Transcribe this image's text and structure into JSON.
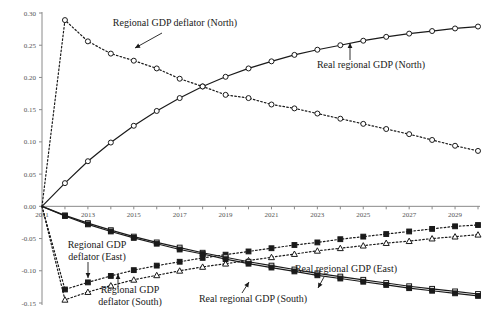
{
  "chart_data": {
    "type": "line",
    "title": "",
    "subtitle": "",
    "xlabel": "",
    "ylabel": "",
    "grid": false,
    "legend_position": "inline-annotations",
    "x": [
      2011,
      2012,
      2013,
      2014,
      2015,
      2016,
      2017,
      2018,
      2019,
      2020,
      2021,
      2022,
      2023,
      2024,
      2025,
      2026,
      2027,
      2028,
      2029,
      2030
    ],
    "xlim": [
      2011,
      2030
    ],
    "ylim": [
      -0.15,
      0.3
    ],
    "xticks": [
      2011,
      2013,
      2015,
      2017,
      2019,
      2021,
      2023,
      2025,
      2027,
      2029
    ],
    "xtick_labels": [
      "2011",
      "2013",
      "2015",
      "2017",
      "2019",
      "2021",
      "2023",
      "2025",
      "2027",
      "2029"
    ],
    "yticks": [
      0.3,
      0.25,
      0.2,
      0.15,
      0.1,
      0.05,
      0.0,
      -0.05,
      -0.1,
      -0.15
    ],
    "ytick_labels": [
      "0.30",
      "0.25",
      "0.20",
      "0.15",
      "0.10",
      "0.05",
      "0.00",
      "-0.05",
      "-0.10",
      "-0.15"
    ],
    "series": [
      {
        "name": "Regional GDP deflator (North)",
        "style": "dotted",
        "marker": "circle-open",
        "values": [
          0.0,
          0.289,
          0.256,
          0.237,
          0.226,
          0.214,
          0.198,
          0.186,
          0.173,
          0.168,
          0.158,
          0.152,
          0.144,
          0.136,
          0.128,
          0.12,
          0.112,
          0.103,
          0.094,
          0.086
        ]
      },
      {
        "name": "Real regional GDP (North)",
        "style": "solid",
        "marker": "circle-open",
        "values": [
          0.0,
          0.036,
          0.07,
          0.099,
          0.125,
          0.148,
          0.168,
          0.186,
          0.201,
          0.214,
          0.225,
          0.235,
          0.243,
          0.25,
          0.257,
          0.263,
          0.268,
          0.272,
          0.276,
          0.279
        ]
      },
      {
        "name": "Regional GDP deflator (East)",
        "style": "dotted",
        "marker": "square-filled",
        "values": [
          0.0,
          -0.129,
          -0.118,
          -0.108,
          -0.099,
          -0.092,
          -0.086,
          -0.08,
          -0.075,
          -0.07,
          -0.065,
          -0.06,
          -0.056,
          -0.051,
          -0.047,
          -0.043,
          -0.039,
          -0.035,
          -0.031,
          -0.029
        ]
      },
      {
        "name": "Regional GDP deflator (South)",
        "style": "dotted",
        "marker": "triangle-open",
        "values": [
          0.0,
          -0.145,
          -0.133,
          -0.123,
          -0.114,
          -0.107,
          -0.1,
          -0.094,
          -0.089,
          -0.084,
          -0.079,
          -0.074,
          -0.069,
          -0.065,
          -0.061,
          -0.057,
          -0.054,
          -0.05,
          -0.047,
          -0.044
        ]
      },
      {
        "name": "Real regional GDP (East)",
        "style": "solid",
        "marker": "square-open",
        "values": [
          0.0,
          -0.014,
          -0.026,
          -0.037,
          -0.047,
          -0.056,
          -0.064,
          -0.072,
          -0.079,
          -0.086,
          -0.092,
          -0.098,
          -0.104,
          -0.109,
          -0.114,
          -0.119,
          -0.124,
          -0.128,
          -0.132,
          -0.136
        ]
      },
      {
        "name": "Real regional GDP (South)",
        "style": "solid",
        "marker": "square-filled",
        "values": [
          0.0,
          -0.015,
          -0.028,
          -0.039,
          -0.049,
          -0.058,
          -0.067,
          -0.074,
          -0.082,
          -0.089,
          -0.095,
          -0.101,
          -0.107,
          -0.112,
          -0.117,
          -0.122,
          -0.127,
          -0.131,
          -0.135,
          -0.139
        ]
      }
    ],
    "annotations": [
      {
        "label": "Regional GDP deflator (North)",
        "lines": [
          "Regional GDP deflator (North)"
        ],
        "text_x": 175,
        "text_y": 26,
        "arrow_from_x": 162,
        "arrow_from_y": 33,
        "arrow_to_x": 135,
        "arrow_to_y": 48
      },
      {
        "label": "Real regional GDP (North)",
        "lines": [
          "Real regional GDP (North)"
        ],
        "text_x": 371,
        "text_y": 68,
        "arrow_from_x": 350,
        "arrow_from_y": 60,
        "arrow_to_x": 350,
        "arrow_to_y": 43
      },
      {
        "label": "Regional GDP deflator (East)",
        "lines": [
          "Regional GDP",
          "deflator (East)"
        ],
        "text_x": 97,
        "text_y": 248,
        "arrow_from_x": 88,
        "arrow_from_y": 262,
        "arrow_to_x": 88,
        "arrow_to_y": 278
      },
      {
        "label": "Regional GDP deflator (South)",
        "lines": [
          "Regional GDP",
          "deflator (South)"
        ],
        "text_x": 130,
        "text_y": 293,
        "arrow_from_x": 118,
        "arrow_from_y": 288,
        "arrow_to_x": 118,
        "arrow_to_y": 274
      },
      {
        "label": "Real regional GDP (East)",
        "lines": [
          "Real regional GDP (East)"
        ],
        "text_x": 346,
        "text_y": 272,
        "arrow_from_x": 324,
        "arrow_from_y": 277,
        "arrow_to_x": 318,
        "arrow_to_y": 288
      },
      {
        "label": "Real regional GDP (South)",
        "lines": [
          "Real regional GDP (South)"
        ],
        "text_x": 253,
        "text_y": 302,
        "arrow_from_x": 242,
        "arrow_from_y": 293,
        "arrow_to_x": 249,
        "arrow_to_y": 282
      }
    ],
    "colors": {
      "line": "#1a1a1a",
      "axis": "#8a8a8a",
      "tick_label": "#555555",
      "background": "#ffffff",
      "marker_fill": "#ffffff"
    }
  }
}
